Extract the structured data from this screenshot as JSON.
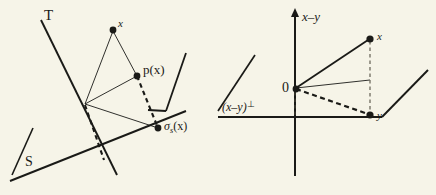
{
  "figure": {
    "background_color": "#f6f4e8",
    "ink_color": "#1a1a17",
    "width": 436,
    "height": 195
  },
  "left_diagram": {
    "name": "projection-onto-subspace-diagram",
    "labels": {
      "subspace_T": "T",
      "subspace_S": "S",
      "point_x": "x",
      "projection": "p(x)",
      "reflection_sigma": "σ",
      "reflection_subscript": "s",
      "reflection_arg": "(x)"
    },
    "points": {
      "x": [
        113,
        29
      ],
      "p_x": [
        137,
        75
      ],
      "sigma_s_x": [
        158,
        128
      ],
      "vertex": [
        85,
        104
      ]
    }
  },
  "right_diagram": {
    "name": "orthogonal-decomposition-diagram",
    "labels": {
      "axis_vertical": "x–y",
      "plane": "(x–y)",
      "plane_perp": "⊥",
      "origin": "0",
      "point_x": "x",
      "point_y": "y"
    },
    "points": {
      "origin": [
        295,
        88
      ],
      "x": [
        370,
        38
      ],
      "y": [
        370,
        115
      ]
    }
  }
}
